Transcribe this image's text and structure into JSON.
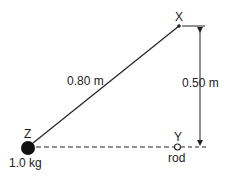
{
  "diagram": {
    "points": {
      "x": "X",
      "y": "Y",
      "z": "Z"
    },
    "labels": {
      "string_length": "0.80 m",
      "height": "0.50 m",
      "mass": "1.0 kg",
      "rod": "rod"
    },
    "colors": {
      "line": "#222222",
      "background": "#ffffff"
    }
  }
}
